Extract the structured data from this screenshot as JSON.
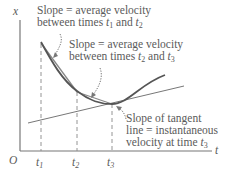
{
  "figure": {
    "axes": {
      "y_label": "x",
      "x_label": "t",
      "origin_label": "O"
    },
    "ticks": [
      {
        "name": "t",
        "sub": "1"
      },
      {
        "name": "t",
        "sub": "2"
      },
      {
        "name": "t",
        "sub": "3"
      }
    ],
    "annotations": {
      "chord1": {
        "line1": "Slope  = average velocity",
        "line2_prefix": "between times ",
        "t_a": "t",
        "t_a_sub": "1",
        "and": " and ",
        "t_b": "t",
        "t_b_sub": "2"
      },
      "chord2": {
        "line1": "Slope  = average velocity",
        "line2_prefix": "between times ",
        "t_a": "t",
        "t_a_sub": "2",
        "and": " and ",
        "t_b": "t",
        "t_b_sub": "3"
      },
      "tangent": {
        "line1": "Slope of tangent",
        "line2": "line = instantaneous",
        "line3_prefix": "velocity at time ",
        "t": "t",
        "t_sub": "3"
      }
    },
    "colors": {
      "axis": "#777777",
      "curve": "#555555",
      "chord": "#8a8a8a",
      "tangent": "#777777",
      "text": "#5a5a5a"
    }
  }
}
